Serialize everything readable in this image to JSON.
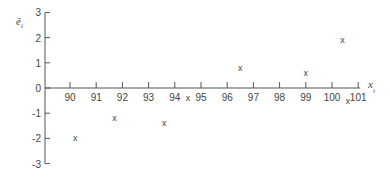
{
  "chart_data": {
    "type": "scatter",
    "title": "",
    "xlabel": "x_i",
    "ylabel": "ê_i",
    "xlabel_main": "x",
    "xlabel_sub": "i",
    "ylabel_main": "ê",
    "ylabel_sub": "i",
    "xlim": [
      89,
      101
    ],
    "ylim": [
      -3,
      3
    ],
    "x_ticks": [
      90,
      91,
      92,
      93,
      94,
      95,
      96,
      97,
      98,
      99,
      100,
      101
    ],
    "y_ticks": [
      3,
      2,
      1,
      0,
      -1,
      -2,
      -3
    ],
    "grid": false,
    "legend": null,
    "marker": "x",
    "series": [
      {
        "name": "residuals",
        "points": [
          {
            "x": 90.2,
            "y": -2.0
          },
          {
            "x": 91.7,
            "y": -1.2
          },
          {
            "x": 93.6,
            "y": -1.4
          },
          {
            "x": 94.5,
            "y": -0.4
          },
          {
            "x": 96.5,
            "y": 0.8
          },
          {
            "x": 99.0,
            "y": 0.6
          },
          {
            "x": 100.4,
            "y": 1.9
          },
          {
            "x": 100.6,
            "y": -0.5
          }
        ]
      }
    ]
  }
}
